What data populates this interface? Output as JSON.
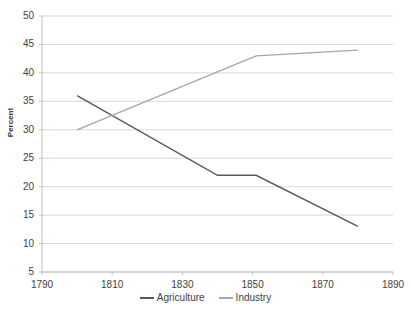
{
  "chart_data": {
    "type": "line",
    "title": "",
    "xlabel": "",
    "ylabel": "Percent",
    "xlim": [
      1790,
      1890
    ],
    "ylim": [
      5,
      50
    ],
    "xticks": [
      1790,
      1810,
      1830,
      1850,
      1870,
      1890
    ],
    "yticks": [
      5,
      10,
      15,
      20,
      25,
      30,
      35,
      40,
      45,
      50
    ],
    "xtick_labels": [
      "1790",
      "1810",
      "1830",
      "1850",
      "1870",
      "1890"
    ],
    "ytick_labels": [
      "5",
      "10",
      "15",
      "20",
      "25",
      "30",
      "35",
      "40",
      "45",
      "50"
    ],
    "grid": "horizontal",
    "legend_position": "bottom-center",
    "series": [
      {
        "name": "Agriculture",
        "color": "#595959",
        "x": [
          1800,
          1840,
          1851,
          1880
        ],
        "values": [
          36,
          22,
          22,
          13
        ]
      },
      {
        "name": "Industry",
        "color": "#a6a6a6",
        "x": [
          1800,
          1851,
          1880
        ],
        "values": [
          30,
          43,
          44
        ]
      }
    ]
  },
  "legend": {
    "items": [
      {
        "label": "Agriculture",
        "color": "#595959"
      },
      {
        "label": "Industry",
        "color": "#a6a6a6"
      }
    ]
  },
  "axes": {
    "y_title": "Percent"
  },
  "colors": {
    "grid": "#d9d9d9",
    "axis": "#bfbfbf",
    "text": "#3f3f3f",
    "background": "#ffffff"
  }
}
